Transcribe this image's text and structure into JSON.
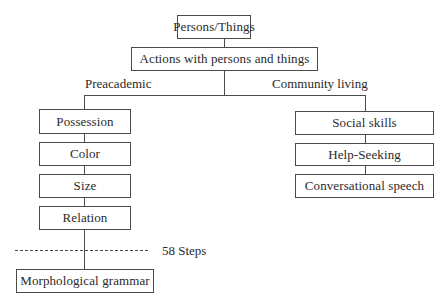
{
  "diagram": {
    "root": {
      "label": "Persons/Things"
    },
    "level2": {
      "label": "Actions with persons and things"
    },
    "branches": {
      "left": {
        "label": "Preacademic",
        "items": [
          {
            "label": "Possession"
          },
          {
            "label": "Color"
          },
          {
            "label": "Size"
          },
          {
            "label": "Relation"
          }
        ],
        "divider_label": "58 Steps",
        "final": {
          "label": "Morphological grammar"
        }
      },
      "right": {
        "label": "Community living",
        "items": [
          {
            "label": "Social skills"
          },
          {
            "label": "Help-Seeking"
          },
          {
            "label": "Conversational speech"
          }
        ]
      }
    }
  }
}
